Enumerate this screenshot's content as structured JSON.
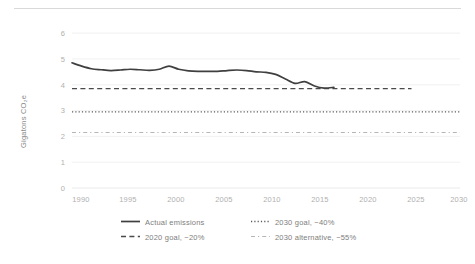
{
  "chart_data": {
    "type": "line",
    "title": "",
    "xlabel": "",
    "ylabel": "Gigatons CO₂e",
    "xlim": [
      1990,
      2030
    ],
    "ylim": [
      0,
      6
    ],
    "grid": true,
    "legend_position": "bottom",
    "y_ticks": [
      "0",
      "1",
      "2",
      "3",
      "4",
      "5",
      "6"
    ],
    "x_ticks": [
      "1990",
      "1995",
      "2000",
      "2005",
      "2010",
      "2015",
      "2020",
      "2025",
      "2030"
    ],
    "series": [
      {
        "name": "Actual emissions",
        "style": "solid",
        "color": "#3f3f3f",
        "x": [
          1990,
          1991,
          1992,
          1993,
          1994,
          1995,
          1996,
          1997,
          1998,
          1999,
          2000,
          2001,
          2002,
          2003,
          2004,
          2005,
          2006,
          2007,
          2008,
          2009,
          2010,
          2011,
          2012,
          2013,
          2014,
          2015,
          2016,
          2017
        ],
        "values": [
          4.85,
          4.72,
          4.62,
          4.58,
          4.55,
          4.57,
          4.6,
          4.58,
          4.56,
          4.6,
          4.72,
          4.6,
          4.54,
          4.52,
          4.52,
          4.52,
          4.55,
          4.57,
          4.55,
          4.5,
          4.48,
          4.4,
          4.22,
          4.05,
          4.12,
          3.95,
          3.87,
          3.9
        ]
      },
      {
        "name": "2020 goal, −20%",
        "style": "dashed",
        "color": "#4a4a4a",
        "x": [
          1990,
          2025
        ],
        "values": [
          3.85,
          3.85
        ]
      },
      {
        "name": "2030 goal, −40%",
        "style": "dotted",
        "color": "#5a5a5a",
        "x": [
          1990,
          2030
        ],
        "values": [
          2.95,
          2.95
        ]
      },
      {
        "name": "2030 alternative, −55%",
        "style": "dashdot",
        "color": "#b5b5b5",
        "x": [
          1990,
          2030
        ],
        "values": [
          2.15,
          2.15
        ]
      }
    ]
  },
  "axis": {
    "y_title": "Gigatons CO₂e",
    "y_ticks": {
      "t0": "0",
      "t1": "1",
      "t2": "2",
      "t3": "3",
      "t4": "4",
      "t5": "5",
      "t6": "6"
    },
    "x_ticks": {
      "t1990": "1990",
      "t1995": "1995",
      "t2000": "2000",
      "t2005": "2005",
      "t2010": "2010",
      "t2015": "2015",
      "t2020": "2020",
      "t2025": "2025",
      "t2030": "2030"
    }
  },
  "legend": {
    "items": [
      {
        "label": "Actual emissions"
      },
      {
        "label": "2020 goal, −20%"
      },
      {
        "label": "2030 goal, −40%"
      },
      {
        "label": "2030 alternative, −55%"
      }
    ]
  }
}
